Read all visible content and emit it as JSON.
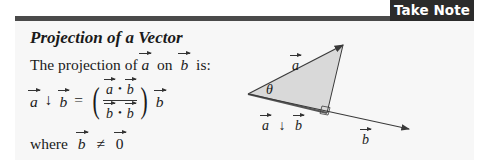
{
  "header": {
    "tab_label": "Take Note",
    "colors": {
      "tab_bg": "#2b2b2b",
      "bar": "#4a4a4a",
      "panel_bg": "#f7f7f7"
    }
  },
  "note": {
    "title": "Projection of a Vector",
    "intro": {
      "prefix": "The projection of",
      "vec_a": "a",
      "middle": "on",
      "vec_b": "b",
      "suffix": "is:"
    },
    "formula": {
      "lhs_a": "a",
      "proj_symbol": "↓",
      "lhs_b": "b",
      "equals": "=",
      "num_a": "a",
      "num_dot": "•",
      "num_b": "b",
      "den_b1": "b",
      "den_dot": "•",
      "den_b2": "b",
      "rhs_b": "b"
    },
    "condition": {
      "prefix": "where",
      "vec_b": "b",
      "neq": "≠",
      "zero": "0"
    }
  },
  "diagram": {
    "label_a": "a",
    "label_theta": "θ",
    "label_proj_a": "a",
    "label_proj_symbol": "↓",
    "label_proj_b": "b",
    "label_b": "b",
    "colors": {
      "triangle_fill": "#d9d9d9",
      "stroke": "#3a3a3a"
    }
  }
}
